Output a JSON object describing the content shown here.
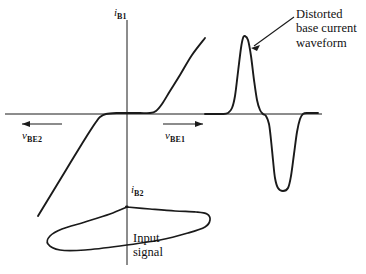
{
  "figure": {
    "kind": "transfer-characteristic-with-waveforms",
    "background_color": "#ffffff",
    "stroke_color": "#1a1a1a"
  },
  "axes": {
    "vertical_axis_label_top": "i",
    "vertical_axis_label_top_sub": "B1",
    "vertical_axis_label_bottom": "i",
    "vertical_axis_label_bottom_sub": "B2",
    "left_arrow_label": "v",
    "left_arrow_label_sub": "BE2",
    "right_arrow_label": "v",
    "right_arrow_label_sub": "BE1"
  },
  "annotations": {
    "distorted_line1": "Distorted",
    "distorted_line2": "base current",
    "distorted_line3": "waveform",
    "input_line1": "Input",
    "input_line2": "signal"
  },
  "chart_data": {
    "type": "line",
    "title": "",
    "xlabel": "v_BE",
    "ylabel": "i_B",
    "grid": false,
    "legend": null,
    "origin_px": {
      "x": 127,
      "y": 114
    },
    "series": [
      {
        "name": "transfer-characteristic",
        "description": "Base current vs base-emitter voltage: reverse breakdown on lower left, flat cutoff region, exponential forward conduction upper right",
        "points_px": [
          [
            38,
            216
          ],
          [
            52,
            193
          ],
          [
            66,
            170
          ],
          [
            80,
            147
          ],
          [
            90,
            131
          ],
          [
            96,
            122
          ],
          [
            100,
            117
          ],
          [
            106,
            114
          ],
          [
            118,
            113
          ],
          [
            127,
            113
          ],
          [
            140,
            113
          ],
          [
            150,
            113
          ],
          [
            156,
            111
          ],
          [
            162,
            104
          ],
          [
            170,
            91
          ],
          [
            180,
            75
          ],
          [
            192,
            55
          ],
          [
            205,
            38
          ]
        ]
      },
      {
        "name": "distorted-base-current-waveform",
        "description": "Output waveform: narrow tall positive pulse followed by wider deep negative pulse",
        "points_px": [
          [
            205,
            114
          ],
          [
            222,
            114
          ],
          [
            228,
            113
          ],
          [
            232,
            108
          ],
          [
            235,
            96
          ],
          [
            238,
            72
          ],
          [
            241,
            48
          ],
          [
            243,
            38
          ],
          [
            245,
            36
          ],
          [
            248,
            40
          ],
          [
            251,
            56
          ],
          [
            254,
            80
          ],
          [
            257,
            100
          ],
          [
            260,
            110
          ],
          [
            263,
            114
          ],
          [
            266,
            116
          ],
          [
            269,
            124
          ],
          [
            271,
            140
          ],
          [
            273,
            160
          ],
          [
            275,
            178
          ],
          [
            278,
            188
          ],
          [
            283,
            191
          ],
          [
            288,
            188
          ],
          [
            291,
            176
          ],
          [
            294,
            154
          ],
          [
            297,
            132
          ],
          [
            300,
            119
          ],
          [
            303,
            114
          ],
          [
            308,
            113
          ],
          [
            318,
            113
          ]
        ]
      },
      {
        "name": "input-signal",
        "description": "Sinusoidal input drawn sideways below the horizontal axis, crossing the vertical axis",
        "points_px": [
          [
            127,
            207
          ],
          [
            150,
            209
          ],
          [
            175,
            211
          ],
          [
            196,
            212
          ],
          [
            207,
            214
          ],
          [
            210,
            220
          ],
          [
            205,
            227
          ],
          [
            188,
            233
          ],
          [
            160,
            240
          ],
          [
            120,
            246
          ],
          [
            85,
            250
          ],
          [
            60,
            250
          ],
          [
            48,
            244
          ],
          [
            50,
            236
          ],
          [
            62,
            229
          ],
          [
            85,
            222
          ],
          [
            110,
            214
          ],
          [
            127,
            207
          ]
        ]
      }
    ],
    "axis_lines_px": {
      "horizontal": {
        "x1": 5,
        "y1": 114,
        "x2": 322,
        "y2": 114
      },
      "vertical": {
        "x1": 127,
        "y1": 20,
        "x2": 127,
        "y2": 265
      }
    },
    "direction_arrows_px": {
      "left": {
        "x1": 62,
        "y1": 124,
        "x2": 20,
        "y2": 124
      },
      "right": {
        "x1": 163,
        "y1": 124,
        "x2": 205,
        "y2": 124
      }
    },
    "callout_arrow_px": {
      "x1": 294,
      "y1": 17,
      "x2": 251,
      "y2": 47
    }
  }
}
